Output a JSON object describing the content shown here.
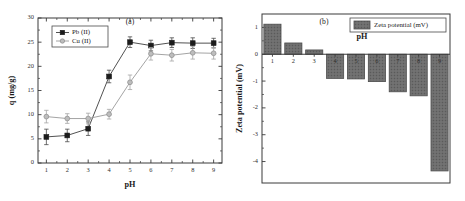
{
  "figure": {
    "panel_a_tag": "(a)",
    "panel_b_tag": "(b)"
  },
  "chart_data": [
    {
      "type": "line",
      "panel": "(a)",
      "title": "",
      "xlabel": "pH",
      "ylabel": "q (mg/g)",
      "xlim": [
        0.6,
        9.4
      ],
      "ylim": [
        0,
        30
      ],
      "xticks": [
        1,
        2,
        3,
        4,
        5,
        6,
        7,
        8,
        9
      ],
      "yticks": [
        0,
        5,
        10,
        15,
        20,
        25,
        30
      ],
      "grid": false,
      "legend_position": "top-left",
      "x": [
        1,
        2,
        3,
        4,
        5,
        6,
        7,
        8,
        9
      ],
      "series": [
        {
          "name": "Pb (II)",
          "marker": "filled-square",
          "color": "#1c1c1c",
          "values": [
            5.4,
            5.7,
            7.1,
            17.9,
            25.0,
            24.3,
            24.9,
            24.8,
            24.8
          ],
          "errors": [
            1.6,
            1.3,
            1.4,
            1.3,
            1.1,
            1.1,
            1.0,
            1.1,
            1.0
          ]
        },
        {
          "name": "Cu (II)",
          "marker": "open-circle",
          "color": "#bdbdbd",
          "values": [
            9.6,
            9.2,
            9.2,
            10.1,
            16.7,
            22.6,
            22.3,
            22.8,
            22.7
          ],
          "errors": [
            1.3,
            1.0,
            1.1,
            1.0,
            1.5,
            1.3,
            1.2,
            1.3,
            1.2
          ]
        }
      ]
    },
    {
      "type": "bar",
      "panel": "(b)",
      "title": "",
      "xlabel": "pH",
      "ylabel": "Zeta potential (mV)",
      "ylim": [
        -4.8,
        1.5
      ],
      "yticks": [
        1,
        0,
        -1,
        -2,
        -3,
        -4
      ],
      "grid": false,
      "legend_position": "top-right",
      "legend_label": "Zeta potential (mV)",
      "bar_color": "#6a6a6a",
      "categories": [
        "1",
        "2",
        "3",
        "4",
        "5",
        "6",
        "7",
        "8",
        "9"
      ],
      "values": [
        1.12,
        0.42,
        0.16,
        -0.9,
        -0.92,
        -1.02,
        -1.4,
        -1.55,
        -4.35
      ]
    }
  ]
}
